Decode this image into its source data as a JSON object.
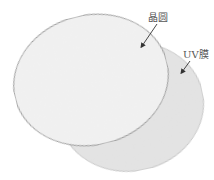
{
  "diagram": {
    "title": "",
    "components": [
      {
        "id": "wafer",
        "label": "晶圆",
        "fill": "#f2f2f2",
        "edge": "#8c8c8c"
      },
      {
        "id": "uv_film",
        "label": "UV膜",
        "fill": "#e4e4e4",
        "edge": "#bdbdbd"
      }
    ],
    "arrow_color": "#333333",
    "background": "#ffffff"
  }
}
